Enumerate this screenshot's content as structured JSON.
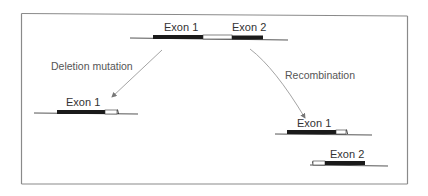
{
  "diagram": {
    "title": "",
    "colors": {
      "frame": "#8a8a8a",
      "dna_line": "#555555",
      "exon_fill": "#1a1a1a",
      "intron_fill": "#ffffff",
      "arrow": "#9a9a9a",
      "text": "#333333"
    },
    "original_gene": {
      "exon1_label": "Exon 1",
      "exon2_label": "Exon 2"
    },
    "deletion": {
      "label": "Deletion mutation",
      "result": {
        "exon1_label": "Exon 1"
      }
    },
    "recombination": {
      "label": "Recombination",
      "result": {
        "exon1_label": "Exon 1",
        "exon2_label": "Exon 2"
      }
    }
  }
}
